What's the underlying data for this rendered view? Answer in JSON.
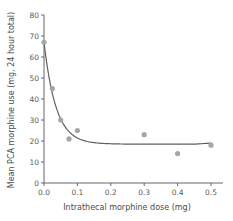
{
  "chart_data": {
    "type": "scatter",
    "title": "",
    "xlabel": "Intrathecal morphine dose (mg)",
    "ylabel": "Mean PCA morphine use (mg, 24 hour total)",
    "xlim": [
      0.0,
      0.5
    ],
    "ylim": [
      0,
      80
    ],
    "x_ticks": [
      "0.0",
      "0.1",
      "0.2",
      "0.3",
      "0.4",
      "0.5"
    ],
    "y_ticks": [
      "0",
      "10",
      "20",
      "30",
      "40",
      "50",
      "60",
      "70",
      "80"
    ],
    "grid": false,
    "legend": null,
    "series": [
      {
        "name": "Observed",
        "kind": "points",
        "color": "#a6a6a6",
        "x": [
          0.0,
          0.025,
          0.05,
          0.075,
          0.1,
          0.3,
          0.4,
          0.5
        ],
        "y": [
          67,
          45,
          30,
          21,
          25,
          23,
          14,
          18
        ]
      },
      {
        "name": "Fitted curve",
        "kind": "line",
        "color": "#5f5f5f",
        "description": "Exponential decay fit from ~67 at 0.0 to plateau ~18.5"
      }
    ]
  }
}
